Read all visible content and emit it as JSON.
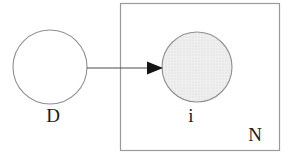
{
  "diagram": {
    "type": "plate-notation-graphical-model",
    "labels": {
      "node_d": "D",
      "node_i": "i",
      "plate": "N"
    },
    "nodes": [
      {
        "id": "D",
        "label": "D",
        "shape": "circle",
        "fill": "white",
        "inside_plate": false
      },
      {
        "id": "i",
        "label": "i",
        "shape": "circle",
        "fill": "stippled-light-gray",
        "inside_plate": true
      }
    ],
    "edges": [
      {
        "from": "D",
        "to": "i",
        "style": "solid-arrow"
      }
    ],
    "plate": {
      "label": "N",
      "contains": [
        "i"
      ]
    },
    "colors": {
      "background": "#ffffff",
      "node_outline": "#8f8f8f",
      "plate_outline": "#9a9a9a",
      "arrow_line": "#4d4d4d",
      "arrow_head": "#141414",
      "text": "#1c1c1c",
      "node_fill": "#ffffff",
      "shaded_node_base": "#efefef",
      "shaded_node_dot": "#d6d6d6"
    }
  }
}
